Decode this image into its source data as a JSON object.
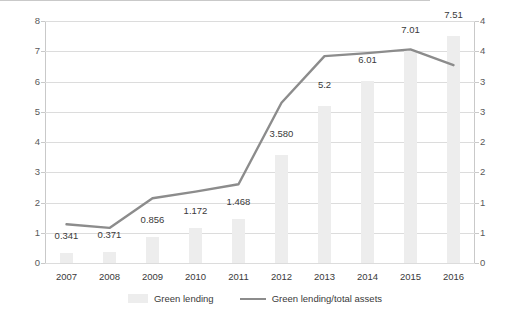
{
  "chart_data": {
    "type": "bar",
    "title": "",
    "subtitle": "",
    "xlabel": "",
    "ylabel": "",
    "y2label": "",
    "grid": true,
    "legend_position": "bottom",
    "categories": [
      "2007",
      "2008",
      "2009",
      "2010",
      "2011",
      "2012",
      "2013",
      "2014",
      "2015",
      "2016"
    ],
    "ylim": [
      0,
      8
    ],
    "yticks": [
      "0",
      "1",
      "2",
      "3",
      "4",
      "5",
      "6",
      "7",
      "8"
    ],
    "y2lim": [
      0,
      4
    ],
    "y2ticks": [
      "0",
      "1",
      "1",
      "2",
      "2",
      "3",
      "3",
      "4",
      "4"
    ],
    "series": [
      {
        "name": "Green lending",
        "type": "bar",
        "axis": "left",
        "color": "#ededed",
        "values": [
          0.341,
          0.371,
          0.856,
          1.172,
          1.468,
          3.58,
          5.2,
          6.01,
          7.01,
          7.51
        ],
        "labels": [
          "0.341",
          "0.371",
          "0.856",
          "1.172",
          "1.468",
          "3.580",
          "5.2",
          "6.01",
          "7.01",
          "7.51"
        ]
      },
      {
        "name": "Green lending/total assets",
        "type": "line",
        "axis": "right",
        "color": "#8c8c8c",
        "values": [
          0.64,
          0.58,
          1.07,
          1.18,
          1.3,
          2.65,
          3.42,
          3.47,
          3.53,
          3.27
        ]
      }
    ]
  },
  "legend": {
    "bar_label": "Green lending",
    "line_label": "Green lending/total assets"
  }
}
